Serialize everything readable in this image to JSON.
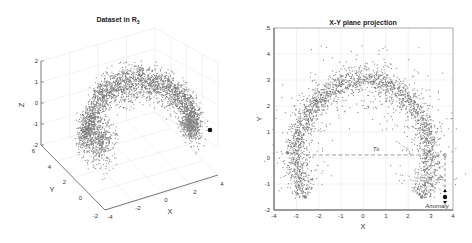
{
  "chart_data": [
    {
      "type": "scatter",
      "projection": "3d",
      "title": "Dataset in R",
      "title_subscript": "3",
      "xlabel": "X",
      "ylabel": "Y",
      "zlabel": "Z",
      "xlim": [
        -4,
        4
      ],
      "ylim": [
        -2,
        6
      ],
      "zlim": [
        -2,
        2
      ],
      "xticks": [
        "-4",
        "-2",
        "0",
        "2",
        "4"
      ],
      "yticks": [
        "-2",
        "0",
        "2",
        "4",
        "6"
      ],
      "zticks": [
        "-2",
        "-1",
        "0",
        "1",
        "2"
      ],
      "grid": true,
      "description": "Dense grey point cloud shaped as a half-ring (arch) with an isolated anomaly point (black) beyond the right end.",
      "series": [
        {
          "name": "data",
          "color": "#777777",
          "shape": "arch",
          "n_points_approx": 4000
        },
        {
          "name": "anomaly",
          "color": "#111111",
          "point": [
            3.7,
            -1.5,
            -1.0
          ]
        }
      ]
    },
    {
      "type": "scatter",
      "title": "X-Y plane projection",
      "xlabel": "X",
      "ylabel": "Y",
      "xlim": [
        -4,
        4
      ],
      "ylim": [
        -2,
        5
      ],
      "xticks": [
        "-4",
        "-3",
        "-2",
        "-1",
        "0",
        "1",
        "2",
        "3",
        "4"
      ],
      "yticks": [
        "-2",
        "-1",
        "0",
        "1",
        "2",
        "3",
        "4",
        "5"
      ],
      "grid": true,
      "description": "Semicircular arch of points with radius ~3 centered at origin; ends at (-2.6,-1.5) and (2.6,-1.5).",
      "series": [
        {
          "name": "data",
          "color": "#777777",
          "shape": "semicircle",
          "center": [
            0,
            0
          ],
          "radius": 3,
          "n_points_approx": 4000
        },
        {
          "name": "anomaly",
          "color": "#111111",
          "point": [
            3.65,
            -1.5
          ]
        }
      ],
      "annotations": [
        {
          "label": "Tx",
          "type": "dashed-horizontal",
          "from": [
            -2.6,
            0.1
          ],
          "to": [
            3.65,
            0.1
          ]
        },
        {
          "label": "Ty",
          "type": "dashed-vertical",
          "from": [
            3.65,
            0.1
          ],
          "to": [
            3.65,
            -1.5
          ]
        },
        {
          "label": "Anomaly",
          "at": [
            3.65,
            -1.5
          ]
        }
      ]
    }
  ],
  "left_plot": {
    "title": "Dataset in R",
    "title_sub": "3",
    "xlabel": "X",
    "ylabel": "Y",
    "zlabel": "Z",
    "zticks": [
      "2",
      "1",
      "0",
      "-1",
      "-2"
    ],
    "yticks": [
      "6",
      "4",
      "2",
      "0",
      "-2"
    ],
    "xticks": [
      "-4",
      "-2",
      "0",
      "2",
      "4"
    ]
  },
  "right_plot": {
    "title": "X-Y plane projection",
    "xlabel": "X",
    "ylabel": "Y",
    "xticks": [
      "-4",
      "-3",
      "-2",
      "-1",
      "0",
      "1",
      "2",
      "3",
      "4"
    ],
    "yticks": [
      "5",
      "4",
      "3",
      "2",
      "1",
      "0",
      "-1",
      "-2"
    ],
    "tx_label": "Tx",
    "ty_label": "Ty",
    "anomaly_label": "Anomaly"
  },
  "colors": {
    "points": "#7a7a7a",
    "anomaly": "#111111",
    "axis": "#555555",
    "grid": "#e6e6e6",
    "dash": "#999999"
  }
}
